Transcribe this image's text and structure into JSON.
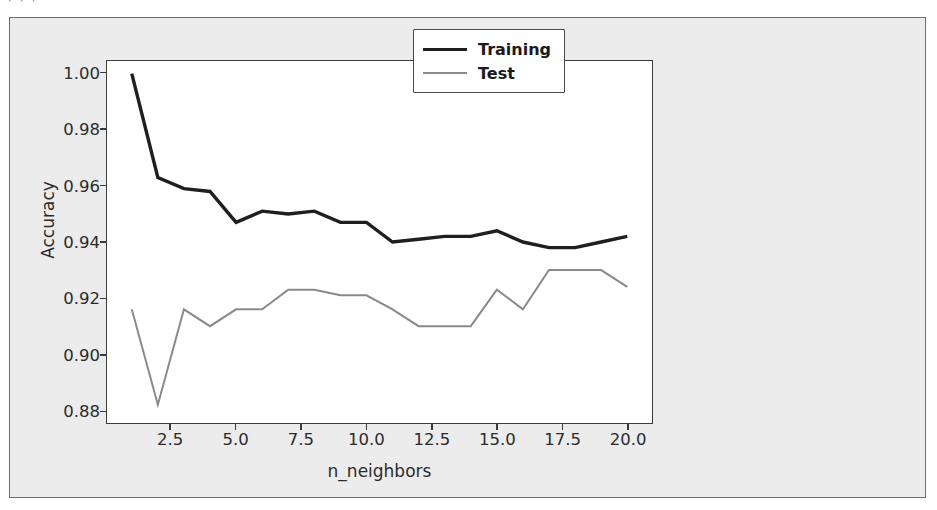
{
  "page": {
    "top_artifact_text": "⌐⌐⌐",
    "background_color": "#ececec",
    "plot_background_color": "#ffffff",
    "frame_color": "#6d6d6d"
  },
  "legend": {
    "position": "upper right",
    "entries": [
      {
        "label": "Training",
        "color": "#1f1f1f",
        "linewidth": "thick"
      },
      {
        "label": "Test",
        "color": "#8a8a8a",
        "linewidth": "thin"
      }
    ]
  },
  "axes": {
    "xlabel": "n_neighbors",
    "ylabel": "Accuracy",
    "xticks": [
      "2.5",
      "5.0",
      "7.5",
      "10.0",
      "12.5",
      "15.0",
      "17.5",
      "20.0"
    ],
    "yticks": [
      "0.88",
      "0.90",
      "0.92",
      "0.94",
      "0.96",
      "0.98",
      "1.00"
    ]
  },
  "chart_data": {
    "type": "line",
    "title": "",
    "xlabel": "n_neighbors",
    "ylabel": "Accuracy",
    "xlim": [
      0.05,
      20.95
    ],
    "ylim": [
      0.8755,
      1.0045
    ],
    "xticks": [
      2.5,
      5.0,
      7.5,
      10.0,
      12.5,
      15.0,
      17.5,
      20.0
    ],
    "yticks": [
      0.88,
      0.9,
      0.92,
      0.94,
      0.96,
      0.98,
      1.0
    ],
    "grid": false,
    "legend_position": "upper right",
    "x": [
      1,
      2,
      3,
      4,
      5,
      6,
      7,
      8,
      9,
      10,
      11,
      12,
      13,
      14,
      15,
      16,
      17,
      18,
      19,
      20
    ],
    "series": [
      {
        "name": "Training",
        "color": "#1f1f1f",
        "linewidth": 3.4,
        "values": [
          1.0,
          0.963,
          0.959,
          0.958,
          0.947,
          0.951,
          0.95,
          0.951,
          0.947,
          0.947,
          0.94,
          0.941,
          0.942,
          0.942,
          0.944,
          0.94,
          0.938,
          0.938,
          0.94,
          0.942
        ]
      },
      {
        "name": "Test",
        "color": "#8a8a8a",
        "linewidth": 2.0,
        "values": [
          0.916,
          0.882,
          0.916,
          0.91,
          0.916,
          0.916,
          0.923,
          0.923,
          0.921,
          0.921,
          0.916,
          0.91,
          0.91,
          0.91,
          0.923,
          0.916,
          0.93,
          0.93,
          0.93,
          0.924
        ]
      }
    ]
  }
}
